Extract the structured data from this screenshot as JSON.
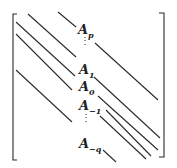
{
  "diagram": {
    "type": "banded-matrix",
    "labels": [
      {
        "base": "A",
        "sub": "p"
      },
      {
        "base": "A",
        "sub": "1"
      },
      {
        "base": "A",
        "sub": "0"
      },
      {
        "base": "A",
        "sub": "−1"
      },
      {
        "base": "A",
        "sub": "−q"
      }
    ],
    "vdots": "⋮",
    "line_color": "#2a2a2a"
  }
}
